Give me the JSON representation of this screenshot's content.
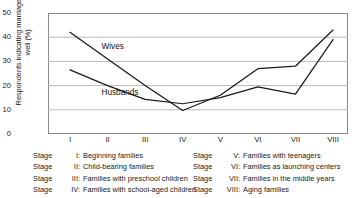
{
  "chart_data": {
    "type": "line",
    "title": "",
    "xlabel": "",
    "ylabel": "Respondents indicating marriage going well (%)",
    "categories": [
      "I",
      "II",
      "III",
      "IV",
      "V",
      "VI",
      "VII",
      "VIII"
    ],
    "ylim": [
      0,
      50
    ],
    "yticks": [
      0,
      10,
      20,
      30,
      40,
      50
    ],
    "grid": "horizontal",
    "legend_position": "inline-annotation",
    "series": [
      {
        "name": "Wives",
        "values": [
          42,
          31,
          20,
          9.7,
          16,
          27,
          28,
          43
        ]
      },
      {
        "name": "Husbands",
        "values": [
          26.5,
          20,
          14.3,
          12.5,
          15,
          19.5,
          16.5,
          39
        ]
      }
    ],
    "annotations": [
      {
        "text": "Wives",
        "stage": "II",
        "value": 36
      },
      {
        "text": "Husbands",
        "stage": "II",
        "value": 17
      }
    ]
  },
  "axis": {
    "yticks": [
      {
        "label": "50"
      },
      {
        "label": "40"
      },
      {
        "label": "30"
      },
      {
        "label": "20"
      },
      {
        "label": "10"
      },
      {
        "label": "0"
      }
    ],
    "xticks": [
      {
        "label": "I"
      },
      {
        "label": "II"
      },
      {
        "label": "III"
      },
      {
        "label": "IV"
      },
      {
        "label": "V"
      },
      {
        "label": "VI"
      },
      {
        "label": "VII"
      },
      {
        "label": "VIII"
      }
    ],
    "ylabel": "Respondents indicating marriage going well (%)"
  },
  "series_labels": {
    "wives": "Wives",
    "husbands": "Husbands"
  },
  "legend": {
    "left": [
      {
        "stage": "Stage",
        "num": "I:",
        "text": "Beginning families"
      },
      {
        "stage": "Stage",
        "num": "II:",
        "text": "Child-bearing families"
      },
      {
        "stage": "Stage",
        "num": "III:",
        "text": "Families with preschool children"
      },
      {
        "stage": "Stage",
        "num": "IV:",
        "text": "Families with school-aged children"
      }
    ],
    "right": [
      {
        "stage": "Stage",
        "num": "V:",
        "text": "Families with teenagers"
      },
      {
        "stage": "Stage",
        "num": "VI:",
        "text": "Families as launching centers"
      },
      {
        "stage": "Stage",
        "num": "VII:",
        "text": "Families in the middle years"
      },
      {
        "stage": "Stage",
        "num": "VIII:",
        "text": "Aging families"
      }
    ]
  },
  "colors": {
    "line": "#1a1a1a",
    "grid": "#b9b9b9",
    "frame": "#8a8a8a",
    "background": "#ffffff"
  }
}
